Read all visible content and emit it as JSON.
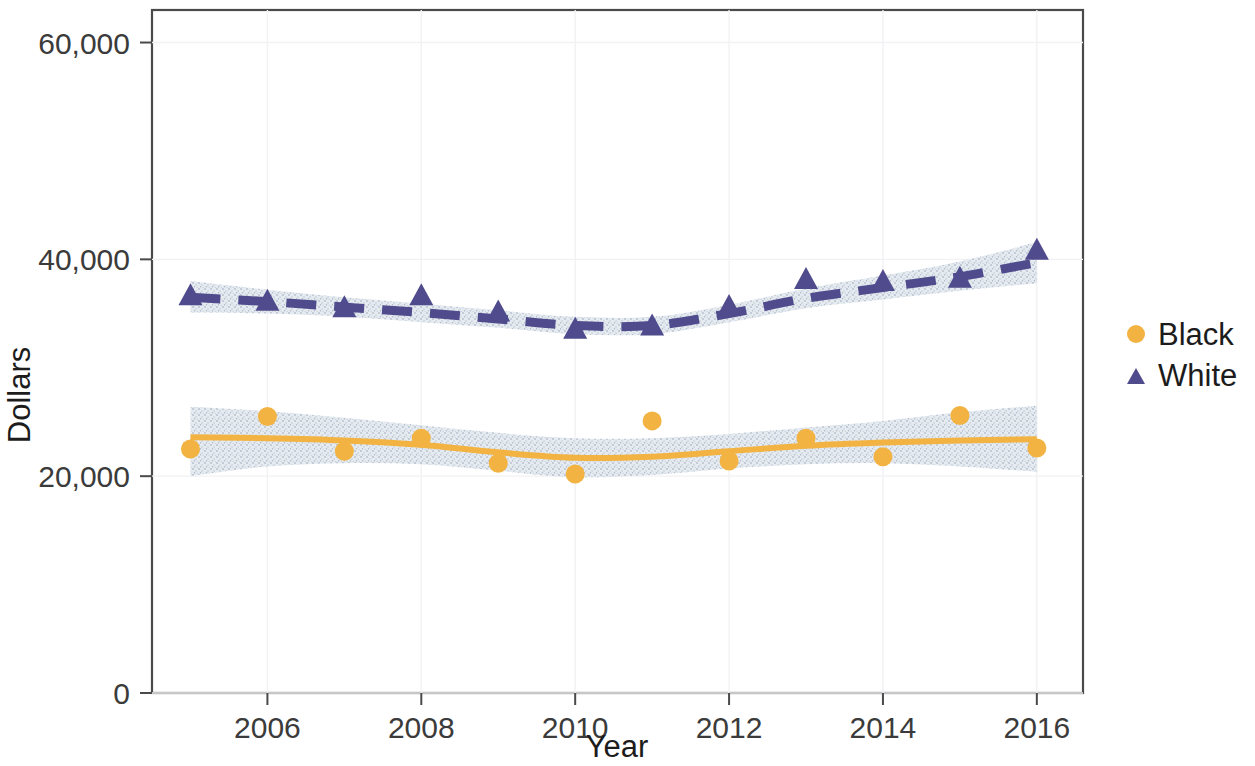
{
  "chart_data": {
    "type": "scatter",
    "title": "",
    "subtitle": "",
    "xlabel": "Year",
    "ylabel": "Dollars",
    "xlim": [
      2004.5,
      2016.6
    ],
    "ylim": [
      0,
      63000
    ],
    "grid": true,
    "legend_position": "right",
    "x_ticks": [
      "2006",
      "2008",
      "2010",
      "2012",
      "2014",
      "2016"
    ],
    "x_tick_values": [
      2006,
      2008,
      2010,
      2012,
      2014,
      2016
    ],
    "y_ticks": [
      "0",
      "20,000",
      "40,000",
      "60,000"
    ],
    "y_tick_values": [
      0,
      20000,
      40000,
      60000
    ],
    "x": [
      2005,
      2006,
      2007,
      2008,
      2009,
      2010,
      2011,
      2012,
      2013,
      2014,
      2015,
      2016
    ],
    "series": [
      {
        "name": "Black",
        "marker": "circle",
        "color": "#F2B342",
        "line_style": "solid",
        "values": [
          22500,
          25500,
          22300,
          23500,
          21200,
          20200,
          25100,
          21400,
          23500,
          21800,
          25600,
          22600
        ],
        "fit": [
          23600,
          23500,
          23300,
          22900,
          22200,
          21700,
          21800,
          22300,
          22800,
          23100,
          23300,
          23400
        ],
        "ci_upper": [
          26400,
          26000,
          25400,
          24700,
          24000,
          23500,
          23500,
          23900,
          24500,
          25100,
          25900,
          26500
        ],
        "ci_lower": [
          20000,
          20900,
          21200,
          21100,
          20500,
          19900,
          20100,
          20700,
          21100,
          21200,
          20900,
          20400
        ]
      },
      {
        "name": "White",
        "marker": "triangle",
        "color": "#4F4B8C",
        "line_style": "dashed",
        "values": [
          36600,
          36100,
          35500,
          36600,
          35100,
          33500,
          33800,
          35600,
          38100,
          37900,
          38200,
          40800
        ],
        "fit": [
          36500,
          36100,
          35600,
          35100,
          34500,
          33900,
          33900,
          35000,
          36400,
          37400,
          38400,
          39700
        ],
        "ci_upper": [
          38000,
          37200,
          36500,
          35900,
          35300,
          34700,
          34700,
          35800,
          37300,
          38500,
          39800,
          41600
        ],
        "ci_lower": [
          35100,
          35000,
          34700,
          34200,
          33700,
          33100,
          33100,
          34200,
          35500,
          36300,
          37100,
          37800
        ]
      }
    ]
  },
  "legend": {
    "entries": [
      {
        "label": "Black",
        "marker": "circle-marker",
        "color": "#F2B342"
      },
      {
        "label": "White",
        "marker": "triangle-marker",
        "color": "#4F4B8C"
      }
    ]
  },
  "axes": {
    "x_title": "Year",
    "y_title": "Dollars"
  },
  "colors": {
    "black_series": "#F2B342",
    "white_series": "#4F4B8C",
    "confidence_band": "#c9d2dc",
    "axis": "#4a4a4a",
    "grid": "#f2f2f4",
    "text": "#1c1c1c"
  }
}
